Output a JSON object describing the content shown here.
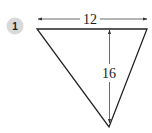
{
  "problem": {
    "number": "1"
  },
  "figure": {
    "shape": "inverted triangle",
    "base_label": "12",
    "height_label": "16"
  },
  "colors": {
    "badge_fill": "#d9d9d9",
    "stroke": "#222222",
    "dimension": "#444444"
  }
}
